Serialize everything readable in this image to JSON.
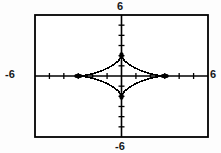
{
  "graph": {
    "title": "",
    "window_labels": {
      "top": "6",
      "bottom": "-6",
      "left": "-6",
      "right": "6"
    }
  },
  "chart_data": {
    "type": "line",
    "title": "",
    "xlabel": "",
    "ylabel": "",
    "xlim": [
      -6,
      6
    ],
    "ylim": [
      -6,
      6
    ],
    "xtick_step": 1,
    "ytick_step": 1,
    "grid": false,
    "legend": null,
    "axes": {
      "x_axis_visible": true,
      "y_axis_visible": true,
      "x_ticks": [
        -6,
        -5,
        -4,
        -3,
        -2,
        -1,
        0,
        1,
        2,
        3,
        4,
        5,
        6
      ],
      "y_ticks": [
        -6,
        -5,
        -4,
        -3,
        -2,
        -1,
        0,
        1,
        2,
        3,
        4,
        5,
        6
      ],
      "tick_labels_shown": false
    },
    "curve": {
      "name": "astroid",
      "equation": "(x/3)^(2/3) + (y/2)^(2/3) = 1",
      "parametric": "x = 3 cos^3(t), y = 2 sin^3(t)",
      "a": 3,
      "b": 2,
      "cusps": [
        [
          3,
          0
        ],
        [
          0,
          2
        ],
        [
          -3,
          0
        ],
        [
          0,
          -2
        ]
      ],
      "color": "#000000",
      "style": "solid",
      "marker": "pixel-dotted"
    },
    "frame": {
      "border_color": "#000000",
      "background": "#ffffff",
      "x_range_px": [
        -6,
        6
      ],
      "y_range_px": [
        -6,
        6
      ]
    }
  },
  "colors": {
    "ink": "#000000",
    "paper": "#ffffff",
    "page": "#fdfdfd",
    "label": "#15171a"
  }
}
